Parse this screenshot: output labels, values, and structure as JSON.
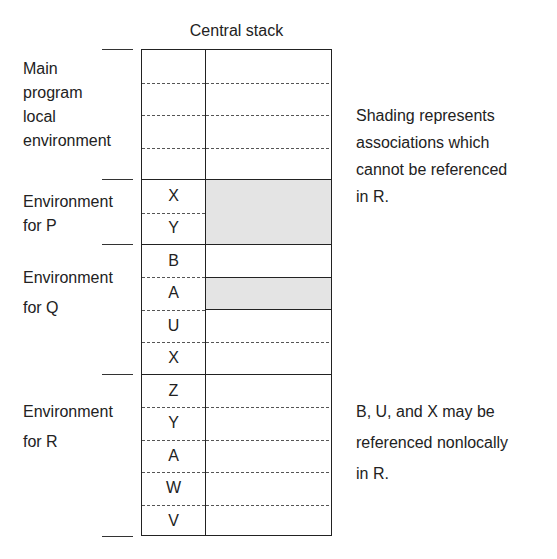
{
  "title": "Central stack",
  "environments": [
    {
      "label_lines": [
        "Main",
        "program",
        "local",
        "environment"
      ],
      "rows": [
        "",
        "",
        "",
        ""
      ]
    },
    {
      "label_lines": [
        "Environment",
        "for P"
      ],
      "rows": [
        "X",
        "Y"
      ]
    },
    {
      "label_lines": [
        "Environment",
        "for Q"
      ],
      "rows": [
        "B",
        "A",
        "U",
        "X"
      ]
    },
    {
      "label_lines": [
        "Environment",
        "for R"
      ],
      "rows": [
        "Z",
        "Y",
        "A",
        "W",
        "V"
      ]
    }
  ],
  "shaded_entries": [
    "P.X",
    "P.Y",
    "Q.A"
  ],
  "notes": {
    "shading": [
      "Shading represents",
      "associations which",
      "cannot be referenced",
      "in R."
    ],
    "nonlocal": [
      "B, U, and X may be",
      "referenced nonlocally",
      "in R."
    ]
  },
  "colors": {
    "shade": "#e4e4e4",
    "line": "#222222"
  }
}
